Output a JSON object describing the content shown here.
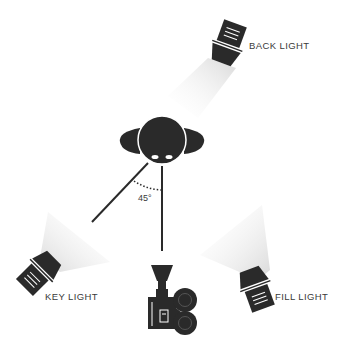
{
  "lights": {
    "back": {
      "label": "BACK LIGHT"
    },
    "key": {
      "label": "KEY LIGHT"
    },
    "fill": {
      "label": "FILL LIGHT"
    }
  },
  "angle": {
    "label": "45°",
    "degrees": 45
  },
  "subject": {
    "name": "head"
  },
  "camera": {
    "name": "film camera"
  },
  "colors": {
    "ink": "#2a2a2a",
    "beam": "#e6e6e6",
    "text": "#3a3a3a"
  }
}
